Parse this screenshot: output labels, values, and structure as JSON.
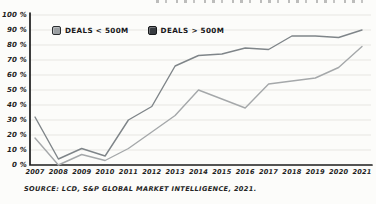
{
  "legend": {
    "items": [
      {
        "label": "DEALS < 500M",
        "swatch_color": "#9b9fa2",
        "swatch_border": "#2a2d30"
      },
      {
        "label": "DEALS > 500M",
        "swatch_color": "#383c41",
        "swatch_border": "#17191b"
      }
    ]
  },
  "source_note": "SOURCE: LCD, S&P GLOBAL MARKET INTELLIGENCE, 2021.",
  "chart_data": {
    "type": "line",
    "x": [
      "2007",
      "2008",
      "2009",
      "2010",
      "2011",
      "2012",
      "2013",
      "2014",
      "2015",
      "2016",
      "2017",
      "2018",
      "2019",
      "2020",
      "2021"
    ],
    "series": [
      {
        "name": "DEALS < 500M",
        "color": "#a5a8aa",
        "values": [
          18,
          0,
          7,
          3,
          11,
          22,
          33,
          50,
          44,
          38,
          54,
          56,
          58,
          65,
          79
        ]
      },
      {
        "name": "DEALS > 500M",
        "color": "#7f8589",
        "values": [
          32,
          4,
          11,
          6,
          30,
          39,
          66,
          73,
          74,
          78,
          77,
          86,
          86,
          85,
          90
        ]
      }
    ],
    "y_ticks": [
      0,
      10,
      20,
      30,
      40,
      50,
      60,
      70,
      80,
      90,
      100
    ],
    "y_tick_suffix": " %",
    "ylim": [
      0,
      100
    ],
    "grid": true,
    "legend_position": "top-left",
    "axis_color": "#1c1c1c",
    "grid_color": "#e7e6e2"
  }
}
